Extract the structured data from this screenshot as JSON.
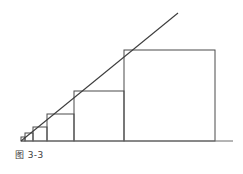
{
  "figure": {
    "caption": "图 3-3",
    "caption_label": "图",
    "caption_number": "3-3",
    "background_color": "#ffffff",
    "stroke_color": "#4a4a4a",
    "baseline_color": "#6b6b6b",
    "ray_color": "#3c3c3c",
    "stroke_width": 1,
    "title": ""
  },
  "geometry": {
    "origin": {
      "x": 21,
      "y": 141
    },
    "baseline": {
      "x1": 21,
      "y1": 141,
      "x2": 233,
      "y2": 141
    },
    "ray": {
      "x1": 21,
      "y1": 141,
      "x2": 178,
      "y2": 13,
      "slope": -0.827
    },
    "growth_ratio": 1.84,
    "squares": [
      {
        "index": 1,
        "x": 21,
        "y": 137,
        "size": 4,
        "label": ""
      },
      {
        "index": 2,
        "x": 25,
        "y": 133,
        "size": 8,
        "label": ""
      },
      {
        "index": 3,
        "x": 33,
        "y": 127,
        "size": 14,
        "label": ""
      },
      {
        "index": 4,
        "x": 47,
        "y": 114,
        "size": 27,
        "label": ""
      },
      {
        "index": 5,
        "x": 74,
        "y": 91,
        "size": 50,
        "label": ""
      },
      {
        "index": 6,
        "x": 124,
        "y": 50,
        "size": 91,
        "label": ""
      }
    ]
  }
}
